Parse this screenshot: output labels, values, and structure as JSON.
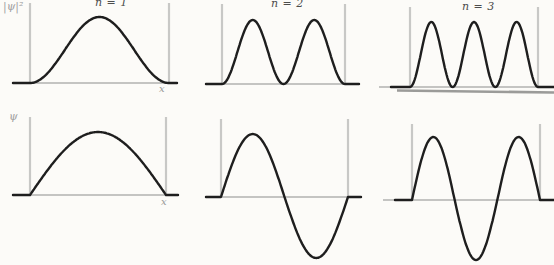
{
  "figure": {
    "background": "#fcfbf8",
    "curve_color": "#1e1e1e",
    "wall_color": "#c8c8c6",
    "baseline_color": "#c4c4c2",
    "artifact_color": "#9b9b99",
    "title_color": "#4d4d4d"
  },
  "axis_labels": {
    "probability_density": "|ψ|²",
    "wavefunction": "ψ",
    "x_top": "x",
    "x_bottom": "x"
  },
  "chart_data": [
    {
      "type": "line",
      "panel": "top-left",
      "title": "n = 1",
      "quantity": "probability_density",
      "n": 1,
      "curve": "sin_squared",
      "formula": "|ψ1(x)|² ∝ sin²(πx/L)",
      "x_range": [
        0,
        1
      ],
      "y_range": [
        0,
        1
      ],
      "x": [
        0,
        0.1,
        0.2,
        0.3,
        0.4,
        0.5,
        0.6,
        0.7,
        0.8,
        0.9,
        1
      ],
      "y": [
        0,
        0.1,
        0.35,
        0.65,
        0.9,
        1,
        0.9,
        0.65,
        0.35,
        0.1,
        0
      ]
    },
    {
      "type": "line",
      "panel": "top-middle",
      "title": "n = 2",
      "quantity": "probability_density",
      "n": 2,
      "curve": "sin_squared",
      "formula": "|ψ2(x)|² ∝ sin²(2πx/L)",
      "x_range": [
        0,
        1
      ],
      "y_range": [
        0,
        1
      ],
      "x": [
        0,
        0.1,
        0.2,
        0.3,
        0.4,
        0.5,
        0.6,
        0.7,
        0.8,
        0.9,
        1
      ],
      "y": [
        0,
        0.35,
        0.9,
        0.9,
        0.35,
        0,
        0.35,
        0.9,
        0.9,
        0.35,
        0
      ]
    },
    {
      "type": "line",
      "panel": "top-right",
      "title": "n = 3",
      "quantity": "probability_density",
      "n": 3,
      "curve": "sin_squared",
      "formula": "|ψ3(x)|² ∝ sin²(3πx/L)",
      "x_range": [
        0,
        1
      ],
      "y_range": [
        0,
        1
      ],
      "x": [
        0,
        0.1,
        0.2,
        0.3,
        0.4,
        0.5,
        0.6,
        0.7,
        0.8,
        0.9,
        1
      ],
      "y": [
        0,
        0.65,
        0.9,
        0.1,
        0.35,
        1,
        0.35,
        0.1,
        0.9,
        0.65,
        0
      ]
    },
    {
      "type": "line",
      "panel": "bottom-left",
      "quantity": "wavefunction",
      "n": 1,
      "curve": "sine",
      "formula": "ψ1(x) ∝ sin(πx/L)",
      "x_range": [
        0,
        1
      ],
      "y_range": [
        -1,
        1
      ],
      "x": [
        0,
        0.1,
        0.2,
        0.3,
        0.4,
        0.5,
        0.6,
        0.7,
        0.8,
        0.9,
        1
      ],
      "y": [
        0,
        0.31,
        0.59,
        0.81,
        0.95,
        1,
        0.95,
        0.81,
        0.59,
        0.31,
        0
      ]
    },
    {
      "type": "line",
      "panel": "bottom-middle",
      "quantity": "wavefunction",
      "n": 2,
      "curve": "sine",
      "formula": "ψ2(x) ∝ sin(2πx/L)",
      "x_range": [
        0,
        1
      ],
      "y_range": [
        -1,
        1
      ],
      "x": [
        0,
        0.1,
        0.2,
        0.3,
        0.4,
        0.5,
        0.6,
        0.7,
        0.8,
        0.9,
        1
      ],
      "y": [
        0,
        0.59,
        0.95,
        0.95,
        0.59,
        0,
        -0.59,
        -0.95,
        -0.95,
        -0.59,
        0
      ]
    },
    {
      "type": "line",
      "panel": "bottom-right",
      "quantity": "wavefunction",
      "n": 3,
      "curve": "sine",
      "formula": "ψ3(x) ∝ sin(3πx/L)",
      "x_range": [
        0,
        1
      ],
      "y_range": [
        -1,
        1
      ],
      "x": [
        0,
        0.1,
        0.2,
        0.3,
        0.4,
        0.5,
        0.6,
        0.7,
        0.8,
        0.9,
        1
      ],
      "y": [
        0,
        0.81,
        0.95,
        0.31,
        -0.59,
        -1,
        -0.59,
        0.31,
        0.95,
        0.81,
        0
      ]
    }
  ]
}
